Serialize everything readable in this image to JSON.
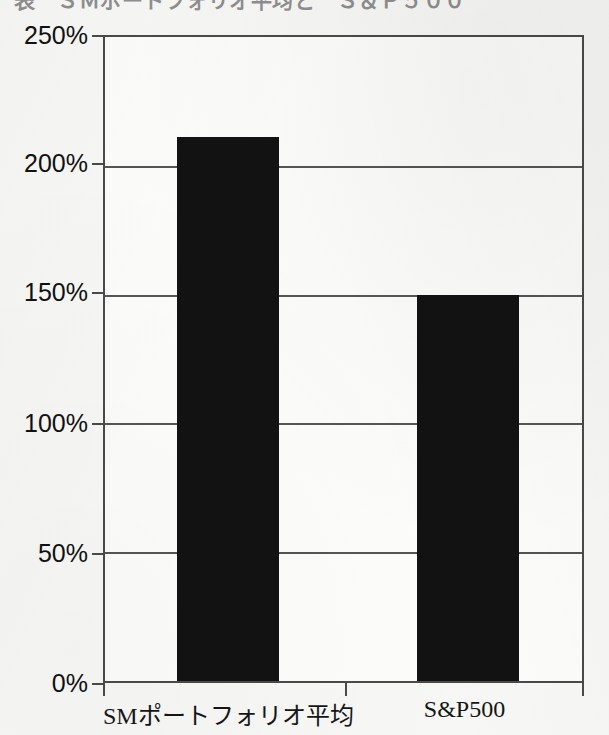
{
  "figure": {
    "title_remnant": "表　ＳＭポートフォリオ平均と　Ｓ＆Ｐ５００",
    "background_color": "#f7f7f5",
    "bar_color": "#121212",
    "axis_color": "#4a4a4a"
  },
  "chart_data": {
    "type": "bar",
    "title": "",
    "xlabel": "",
    "ylabel": "",
    "categories": [
      "SMポートフォリオ平均",
      "S&P500"
    ],
    "values": [
      211,
      150
    ],
    "value_unit": "%",
    "ylim": [
      0,
      250
    ],
    "ytick_values": [
      0,
      50,
      100,
      150,
      200,
      250
    ],
    "ytick_labels": [
      "0%",
      "50%",
      "100%",
      "150%",
      "200%",
      "250%"
    ],
    "grid": true,
    "grid_axis": "y",
    "legend": false,
    "legend_position": "none",
    "series": [
      {
        "name": "",
        "values": [
          211,
          150
        ]
      }
    ]
  }
}
